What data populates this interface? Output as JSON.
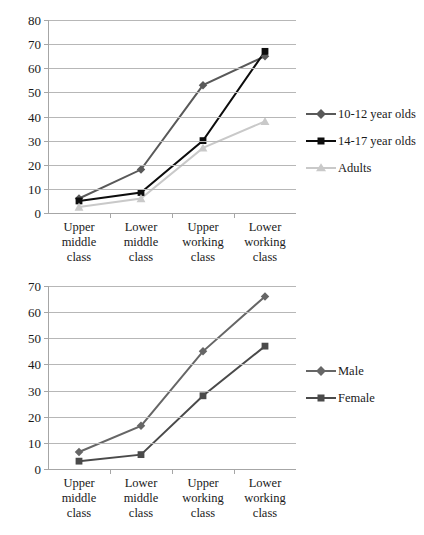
{
  "chart_data": [
    {
      "type": "line",
      "id": "age-groups",
      "title": "",
      "xlabel": "",
      "ylabel": "",
      "categories": [
        "Upper middle class",
        "Lower middle class",
        "Upper working class",
        "Lower working class"
      ],
      "category_lines": [
        [
          "Upper",
          "middle",
          "class"
        ],
        [
          "Lower",
          "middle",
          "class"
        ],
        [
          "Upper",
          "working",
          "class"
        ],
        [
          "Lower",
          "working",
          "class"
        ]
      ],
      "ylim": [
        0,
        80
      ],
      "ytick_step": 10,
      "yticks": [
        80,
        70,
        60,
        50,
        40,
        30,
        20,
        10,
        0
      ],
      "grid": true,
      "legend_position": "right",
      "series": [
        {
          "name": "10-12 year olds",
          "values": [
            6,
            18,
            53,
            65
          ],
          "color": "#595959",
          "marker": "diamond"
        },
        {
          "name": "14-17 year olds",
          "values": [
            5,
            8.5,
            30,
            67
          ],
          "color": "#0d0d0d",
          "marker": "square"
        },
        {
          "name": "Adults",
          "values": [
            2.5,
            6,
            27,
            38
          ],
          "color": "#c9c9c9",
          "marker": "triangle"
        }
      ]
    },
    {
      "type": "line",
      "id": "gender",
      "title": "",
      "xlabel": "",
      "ylabel": "",
      "categories": [
        "Upper middle class",
        "Lower middle class",
        "Upper working class",
        "Lower working class"
      ],
      "category_lines": [
        [
          "Upper",
          "middle",
          "class"
        ],
        [
          "Lower",
          "middle",
          "class"
        ],
        [
          "Upper",
          "working",
          "class"
        ],
        [
          "Lower",
          "working",
          "class"
        ]
      ],
      "ylim": [
        0,
        70
      ],
      "ytick_step": 10,
      "yticks": [
        70,
        60,
        50,
        40,
        30,
        20,
        10,
        0
      ],
      "grid": true,
      "legend_position": "right",
      "series": [
        {
          "name": "Male",
          "values": [
            6.5,
            16.5,
            45,
            66
          ],
          "color": "#666666",
          "marker": "diamond"
        },
        {
          "name": "Female",
          "values": [
            3,
            5.5,
            28,
            47
          ],
          "color": "#4a4a4a",
          "marker": "square"
        }
      ]
    }
  ]
}
